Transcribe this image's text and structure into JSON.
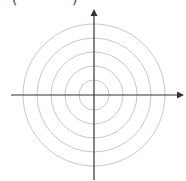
{
  "diagram": {
    "type": "polar-grid",
    "header_fragment": {
      "left": "(",
      "right": ")"
    },
    "center": [
      94,
      95
    ],
    "ring_radii": [
      15,
      29,
      43,
      57,
      71
    ],
    "ring_color": "#c8c8c8",
    "axis_color": "#333333",
    "axes": {
      "horizontal": {
        "from": [
          11,
          95
        ],
        "to": [
          184,
          95
        ],
        "arrow": "right"
      },
      "vertical": {
        "from": [
          94,
          180
        ],
        "to": [
          94,
          9
        ],
        "arrow": "up"
      }
    }
  }
}
